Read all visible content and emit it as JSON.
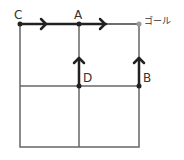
{
  "diagram": {
    "labels": {
      "C": "C",
      "A": "A",
      "goal": "ゴール",
      "D": "D",
      "B": "B"
    },
    "colors": {
      "grid": "#555555",
      "arrow": "#222222",
      "goal_dot": "#999999"
    }
  }
}
